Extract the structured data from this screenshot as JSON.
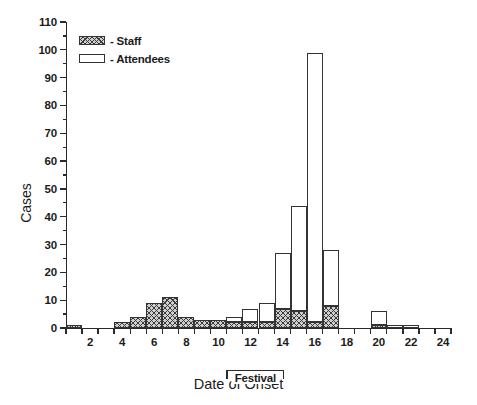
{
  "chart_data": {
    "type": "bar",
    "title": "",
    "xlabel": "Date of Onset",
    "ylabel": "Cases",
    "stacked": true,
    "xlim": [
      1,
      25
    ],
    "ylim": [
      0,
      110
    ],
    "ytick_step": 10,
    "yminor_step": 5,
    "grid": false,
    "legend_position": "top-left",
    "categories": [
      1,
      2,
      3,
      4,
      5,
      6,
      7,
      8,
      9,
      10,
      11,
      12,
      13,
      14,
      15,
      16,
      17,
      18,
      19,
      20,
      21,
      22,
      23,
      24
    ],
    "ytick_labels": [
      "0",
      "10",
      "20",
      "30",
      "40",
      "50",
      "60",
      "70",
      "80",
      "90",
      "100",
      "110"
    ],
    "xtick_labels": [
      "2",
      "4",
      "6",
      "8",
      "10",
      "12",
      "14",
      "16",
      "18",
      "20",
      "22",
      "24"
    ],
    "series": [
      {
        "name": "Staff",
        "color": "#cfcfcf",
        "pattern": "crosshatch",
        "values": [
          1,
          0,
          0,
          2,
          4,
          9,
          11,
          4,
          3,
          3,
          2,
          2,
          2,
          7,
          6,
          2,
          8,
          0,
          0,
          1,
          0,
          0,
          0,
          0
        ]
      },
      {
        "name": "Attendees",
        "color": "#ffffff",
        "pattern": "solid",
        "values": [
          0,
          0,
          0,
          0,
          0,
          0,
          0,
          0,
          0,
          0,
          2,
          5,
          7,
          20,
          38,
          97,
          20,
          0,
          0,
          5,
          1,
          1,
          0,
          0
        ]
      }
    ],
    "totals": [
      1,
      0,
      0,
      2,
      4,
      9,
      11,
      4,
      3,
      3,
      4,
      7,
      9,
      27,
      44,
      99,
      28,
      0,
      0,
      6,
      1,
      1,
      0,
      0
    ],
    "annotations": [
      {
        "name": "festival-bracket",
        "label": "Festival",
        "x_start": 11,
        "x_end": 14.6
      }
    ]
  },
  "legend": {
    "items": [
      {
        "label": "- Staff",
        "key": "staff"
      },
      {
        "label": "- Attendees",
        "key": "attendees"
      }
    ]
  },
  "axes": {
    "y_title": "Cases",
    "x_title": "Date of Onset"
  }
}
